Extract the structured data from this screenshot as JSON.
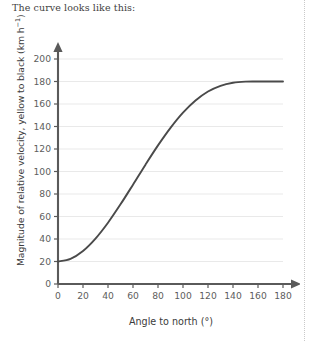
{
  "caption": "The curve looks like this:",
  "colors": {
    "curve": "#4a4a4a",
    "axis": "#5a5a5a",
    "grid": "#e9e9e9",
    "tick_label": "#5d5d5d",
    "text": "#3b3b3b"
  },
  "chart_data": {
    "type": "line",
    "title": "",
    "xlabel": "Angle to north (°)",
    "ylabel": "Magnitude of relative velocity, yellow to black (km h⁻¹)",
    "ylabel_main": "Magnitude of relative velocity, yellow to black (km h",
    "ylabel_sup": "−1",
    "ylabel_close": ")",
    "xlim": [
      0,
      180
    ],
    "ylim": [
      0,
      200
    ],
    "xticks": [
      0,
      20,
      40,
      60,
      80,
      100,
      120,
      140,
      160,
      180
    ],
    "yticks": [
      0,
      20,
      40,
      60,
      80,
      100,
      120,
      140,
      160,
      180,
      200
    ],
    "grid": "horizontal",
    "legend": "none",
    "series": [
      {
        "name": "relative velocity",
        "x": [
          0,
          10,
          20,
          30,
          40,
          50,
          60,
          70,
          80,
          90,
          100,
          110,
          120,
          130,
          140,
          150,
          160,
          170,
          180
        ],
        "values": [
          20.0,
          22.4,
          29.4,
          40.4,
          54.5,
          70.8,
          88.3,
          106.1,
          123.2,
          138.8,
          152.3,
          163.1,
          171.1,
          176.2,
          178.9,
          179.9,
          180.0,
          180.0,
          180.0
        ]
      }
    ]
  }
}
